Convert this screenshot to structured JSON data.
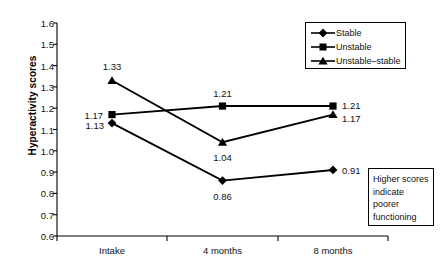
{
  "chart_data": {
    "type": "line",
    "title": "",
    "xlabel": "",
    "ylabel": "Hyperactivity scores",
    "categories": [
      "Intake",
      "4 months",
      "8 months"
    ],
    "ylim": [
      0.6,
      1.6
    ],
    "ytick_step": 0.1,
    "yticks": [
      "1.6",
      "1.5",
      "1.4",
      "1.3",
      "1.2",
      "1.1",
      "1.0",
      "0.9",
      "0.8",
      "0.7",
      "0.6"
    ],
    "grid": false,
    "legend_position": "top-right",
    "series": [
      {
        "name": "Stable",
        "marker": "diamond",
        "values": [
          1.13,
          0.86,
          0.91
        ],
        "point_labels": [
          "1.13",
          "0.86",
          "0.91"
        ]
      },
      {
        "name": "Unstable",
        "marker": "square",
        "values": [
          1.17,
          1.21,
          1.21
        ],
        "point_labels": [
          "1.17",
          "1.21",
          "1.21"
        ]
      },
      {
        "name": "Unstable–stable",
        "marker": "triangle",
        "values": [
          1.33,
          1.04,
          1.17
        ],
        "point_labels": [
          "1.33",
          "1.04",
          "1.17"
        ]
      }
    ],
    "annotations": [
      "Higher scores",
      "indicate",
      "poorer",
      "functioning"
    ],
    "line_color": "#000000",
    "axis_color": "#000000"
  },
  "legend": {
    "items": [
      {
        "label": "Stable",
        "marker": "diamond"
      },
      {
        "label": "Unstable",
        "marker": "square"
      },
      {
        "label": "Unstable–stable",
        "marker": "triangle"
      }
    ]
  },
  "note": {
    "lines": [
      "Higher scores",
      "indicate",
      "poorer",
      "functioning"
    ]
  }
}
